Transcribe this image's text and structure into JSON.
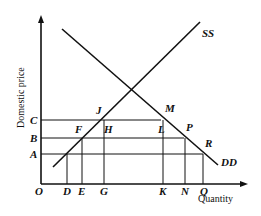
{
  "axes": {
    "y_label": "Domestic price",
    "x_label": "Quantity",
    "origin": "O"
  },
  "curves": {
    "supply": "SS",
    "demand": "DD"
  },
  "price_levels": [
    "A",
    "B",
    "C"
  ],
  "quantity_points": [
    "D",
    "E",
    "G",
    "K",
    "N",
    "Q"
  ],
  "intersection_points": {
    "J": "J",
    "M": "M",
    "F": "F",
    "H": "H",
    "L": "L",
    "P": "P",
    "R": "R"
  }
}
